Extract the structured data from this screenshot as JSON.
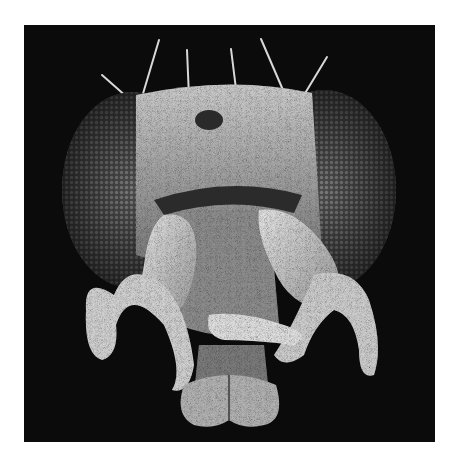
{
  "image": {
    "subject": "Scanning electron micrograph of a fly head (frontal view)",
    "style": "grayscale",
    "colors": {
      "page_background": "#ffffff",
      "image_background": "#0b0b0b",
      "eye": "#5a5a5a",
      "cuticle": "#9a9a9a",
      "highlight": "#e6e6e6"
    },
    "visible_parts": [
      "bristles",
      "compound-eye-left",
      "compound-eye-right",
      "head-capsule",
      "antenna-left",
      "antenna-right",
      "maxillary-palp-left",
      "maxillary-palp-right",
      "proboscis",
      "labellum"
    ]
  }
}
